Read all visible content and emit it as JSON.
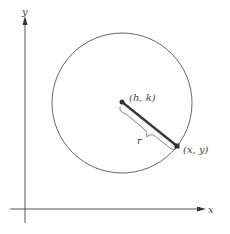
{
  "diagram": {
    "axes": {
      "x_label": "x",
      "y_label": "y"
    },
    "center_label": "(h, k)",
    "point_label": "(x, y)",
    "radius_label": "r",
    "colors": {
      "stroke": "#555555",
      "radius": "#3a3a3a",
      "text": "#444444"
    }
  }
}
